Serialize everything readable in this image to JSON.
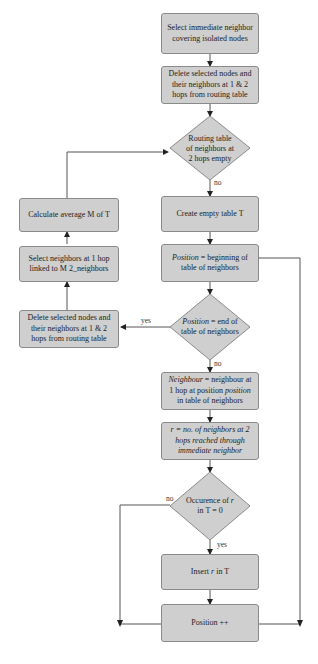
{
  "flowchart": {
    "nodes": {
      "select_immediate": "Select immediate neighbor covering isolated nodes",
      "delete_selected_top": "Delete selected nodes and their neighbors at 1 & 2 hops from routing table",
      "routing_table_empty": "Routing table of neighbors at 2 hops empty",
      "create_table": "Create empty table T",
      "position_begin_italic": "Position",
      "position_begin_rest": " = beginning of table of neighbors",
      "position_end_italic": "Position",
      "position_end_rest": " = end of table of neighbors",
      "neighbour_italic": "Neighbour",
      "neighbour_mid": " = neighbour at 1 hop at position ",
      "neighbour_italic2": "position",
      "neighbour_rest": " in table of neighbors",
      "r_definition": "r = no. of neighbors at 2 hops reached through immediate neighbor",
      "occurence_pre": "Occurence of ",
      "occurence_r": "r",
      "occurence_post": " in T = 0",
      "insert_pre": "Insert ",
      "insert_r": "r",
      "insert_post": " in T",
      "position_inc": "Position ++",
      "calculate_average": "Calculate average M of T",
      "select_neighbors_1hop": "Select neighbors at 1 hop linked to M 2_neighbors",
      "delete_selected_left": "Delete selected nodes and their neighbors at 1 & 2 hops from routing table"
    },
    "edge_labels": {
      "routing_no": "no",
      "position_end_yes": "yes",
      "position_end_no": "no",
      "occurence_no": "no",
      "occurence_yes": "yes"
    }
  }
}
